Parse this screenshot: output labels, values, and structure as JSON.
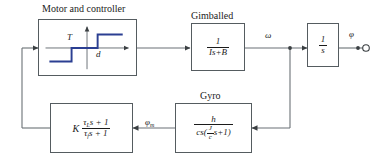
{
  "diagram": {
    "title_motor": "Motor and controller",
    "title_gimballed": "Gimballed",
    "title_gyro": "Gyro"
  },
  "blocks": {
    "motor": {
      "name": "Motor and controller",
      "axis_vertical_label": "T",
      "axis_horizontal_label": "d",
      "curve_type": "relay-nonlinearity",
      "curve_color": "#2b3f92"
    },
    "gimballed": {
      "numerator": "1",
      "den_I": "Is",
      "den_plus": "+",
      "den_B": "B"
    },
    "integrator": {
      "numerator": "1",
      "denominator": "s"
    },
    "gyro": {
      "numerator": "h",
      "den_cs": "cs",
      "den_open": "(",
      "den_frac_num": "J",
      "den_frac_den": "c",
      "den_s": "s",
      "den_plus": "+",
      "den_one": "1",
      "den_close": ")"
    },
    "compensator": {
      "gain": "K",
      "num_tau": "τ",
      "num_sub": "L",
      "num_s": "s",
      "num_plus": "+",
      "num_one": "1",
      "den_tau": "τ",
      "den_sub": "f",
      "den_s": "s",
      "den_plus": "+",
      "den_one": "1"
    }
  },
  "signals": {
    "omega": "ω",
    "phi": "φ",
    "phi_m_sym": "φ",
    "phi_m_sub": "m"
  },
  "colors": {
    "wire": "#6b7176",
    "block_border": "#555c60",
    "curve": "#2b3f92",
    "text": "#1b1b1b"
  }
}
